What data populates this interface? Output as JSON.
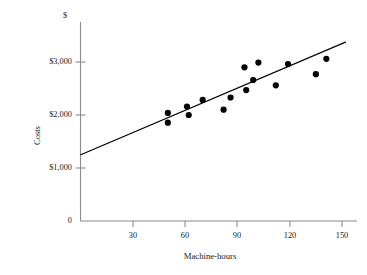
{
  "chart_data": {
    "type": "scatter",
    "title": "",
    "subtitle": "",
    "xlabel": "Machine-hours",
    "ylabel": "Costs",
    "currency_marker": "$",
    "xlim": [
      0,
      157
    ],
    "ylim": [
      0,
      3500
    ],
    "grid": false,
    "legend": null,
    "x_ticks": [
      30,
      60,
      90,
      120,
      150
    ],
    "x_tick_labels": [
      "30",
      "60",
      "90",
      "120",
      "150"
    ],
    "y_ticks": [
      0,
      1000,
      2000,
      3000
    ],
    "y_tick_labels": [
      "0",
      "$1,000",
      "$2,000",
      "$3,000"
    ],
    "points": [
      {
        "x": 50,
        "y": 2040
      },
      {
        "x": 50,
        "y": 1855
      },
      {
        "x": 61,
        "y": 2160
      },
      {
        "x": 62,
        "y": 2000
      },
      {
        "x": 70,
        "y": 2285
      },
      {
        "x": 82,
        "y": 2100
      },
      {
        "x": 86,
        "y": 2330
      },
      {
        "x": 94,
        "y": 2900
      },
      {
        "x": 95,
        "y": 2470
      },
      {
        "x": 99,
        "y": 2660
      },
      {
        "x": 102,
        "y": 2990
      },
      {
        "x": 112,
        "y": 2560
      },
      {
        "x": 119,
        "y": 2960
      },
      {
        "x": 135,
        "y": 2770
      },
      {
        "x": 141,
        "y": 3060
      }
    ],
    "trendline": {
      "kind": "linear-fit",
      "x_start": 0,
      "y_start": 1250,
      "x_end": 152,
      "y_end": 3375
    },
    "marker": {
      "shape": "circle",
      "color": "#000000",
      "radius_px": 3.1
    },
    "line_color": "#000000",
    "axis_color": "#8a8a8a"
  }
}
